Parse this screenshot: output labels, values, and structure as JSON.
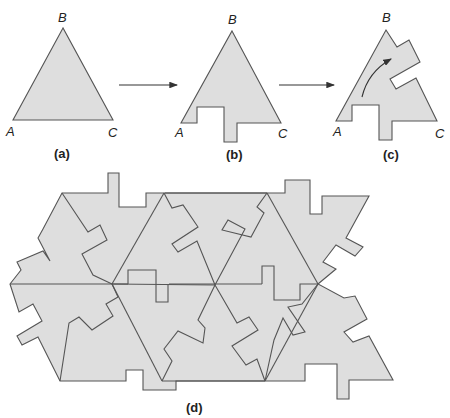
{
  "colors": {
    "fill": "#dedede",
    "stroke": "#555555",
    "text": "#222222"
  },
  "panels": {
    "a": {
      "caption": "(a)",
      "vertices": {
        "A": "A",
        "B": "B",
        "C": "C"
      }
    },
    "b": {
      "caption": "(b)",
      "vertices": {
        "A": "A",
        "B": "B",
        "C": "C"
      }
    },
    "c": {
      "caption": "(c)",
      "vertices": {
        "A": "A",
        "B": "B",
        "C": "C"
      }
    },
    "d": {
      "caption": "(d)"
    }
  },
  "arrows": [
    "a-to-b",
    "b-to-c",
    "rotation-arrow-c"
  ]
}
